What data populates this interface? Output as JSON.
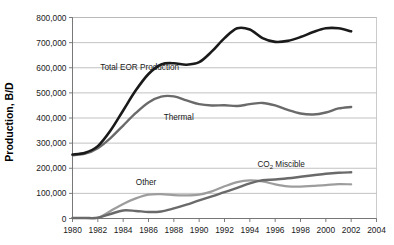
{
  "chart_data": {
    "type": "line",
    "title": "",
    "xlabel": "",
    "ylabel": "Production, B/D",
    "xlim": [
      1980,
      2004
    ],
    "ylim": [
      0,
      800000
    ],
    "grid": true,
    "legend_position": "inline-annotations",
    "xticks": [
      "1980",
      "1982",
      "1984",
      "1986",
      "1988",
      "1990",
      "1992",
      "1994",
      "1996",
      "1998",
      "2000",
      "2002",
      "2004"
    ],
    "yticks": [
      "0",
      "100,000",
      "200,000",
      "300,000",
      "400,000",
      "500,000",
      "600,000",
      "700,000",
      "800,000"
    ],
    "x": [
      1980,
      1981,
      1982,
      1983,
      1984,
      1985,
      1986,
      1987,
      1988,
      1989,
      1990,
      1991,
      1992,
      1993,
      1994,
      1995,
      1996,
      1997,
      1998,
      1999,
      2000,
      2001,
      2002
    ],
    "series": [
      {
        "name": "Total EOR Production",
        "color": "#1a1a1a",
        "width": 2.6,
        "label_x": 1982.2,
        "label_y": 592000,
        "values": [
          255000,
          262000,
          288000,
          350000,
          430000,
          510000,
          575000,
          613000,
          618000,
          612000,
          622000,
          665000,
          718000,
          757000,
          752000,
          718000,
          703000,
          707000,
          722000,
          742000,
          757000,
          757000,
          745000
        ]
      },
      {
        "name": "Thermal",
        "color": "#6a6a6a",
        "width": 2.4,
        "label_x": 1987.2,
        "label_y": 392000,
        "values": [
          252000,
          258000,
          280000,
          320000,
          370000,
          420000,
          462000,
          485000,
          486000,
          470000,
          455000,
          450000,
          451000,
          448000,
          455000,
          460000,
          450000,
          432000,
          418000,
          414000,
          422000,
          438000,
          444000
        ]
      },
      {
        "name": "CO2 Miscible",
        "color": "#6a6a6a",
        "width": 2.4,
        "label_x": 1994.6,
        "label_y": 205000,
        "label_text": "CO",
        "label_sub": "2",
        "label_suffix": " Miscible",
        "values": [
          2000,
          2000,
          3000,
          18000,
          32000,
          30000,
          26000,
          28000,
          40000,
          55000,
          72000,
          88000,
          105000,
          122000,
          140000,
          152000,
          155000,
          160000,
          166000,
          172000,
          178000,
          182000,
          184000
        ]
      },
      {
        "name": "Other",
        "color": "#9d9d9d",
        "width": 2.2,
        "label_x": 1985.0,
        "label_y": 133000,
        "values": [
          2000,
          2000,
          3000,
          30000,
          58000,
          80000,
          95000,
          97000,
          93000,
          92000,
          95000,
          108000,
          128000,
          145000,
          152000,
          148000,
          136000,
          128000,
          127000,
          130000,
          133000,
          137000,
          136000
        ]
      }
    ],
    "series_tail": {
      "note": "values after 2002 extend to 2002 endpoint only",
      "total_eor_end": 665000,
      "thermal_end": 368000,
      "co2_end": 185000,
      "other_end": 110000
    }
  },
  "annotations": {
    "total_eor": "Total EOR Production",
    "thermal": "Thermal",
    "co2_prefix": "CO",
    "co2_sub": "2",
    "co2_suffix": " Miscible",
    "other": "Other"
  }
}
